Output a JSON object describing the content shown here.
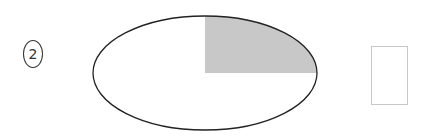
{
  "problem": {
    "number": "2"
  },
  "figure": {
    "shape": "ellipse",
    "divided_into": 4,
    "shaded_parts": 1,
    "shaded_position": "upper-right quarter",
    "outline_color": "#222222",
    "shade_color": "#c8c8c8"
  },
  "answer_box": {
    "value": ""
  }
}
